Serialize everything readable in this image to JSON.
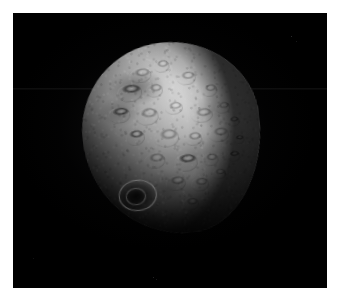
{
  "page": {
    "background_color": "#ffffff",
    "width": 343,
    "height": 302
  },
  "image_frame": {
    "name": "spacecraft-image-frame",
    "background_color": "#000000",
    "left": 13,
    "top": 13,
    "width": 314,
    "height": 275,
    "alt_text": "Grayscale spacecraft image of a heavily cratered irregular asteroid or comet nucleus against black space"
  },
  "subject": {
    "name": "asteroid-nucleus",
    "description": "Irregular, roughly rounded cratered body filling the left-of-center portion of the frame",
    "illumination": "Lit from the upper right; terminator shadow falls across the lower-left limb",
    "surface": "Densely cratered regolith with overlapping impact basins and bright crater rims",
    "bounds": {
      "left": 83,
      "top": 42,
      "right": 248,
      "bottom": 234
    },
    "highlight_color": "#d9d9d9",
    "midtone_color": "#a4a4a4",
    "shadow_color": "#141414",
    "features": [
      {
        "name": "bright-limb-highlight",
        "position": "upper-right",
        "note": "Brightest illuminated region near the sunward limb"
      },
      {
        "name": "dark-albedo-patch",
        "position": "upper-left",
        "note": "Broad low-reflectance smudge along the upper-left flank"
      },
      {
        "name": "large-rimmed-crater",
        "position": "lower-left-terminator",
        "note": "Prominent crater with a bright raised rim catching the light at the shadow boundary"
      },
      {
        "name": "crater-chain",
        "position": "right-limb",
        "note": "Row of small craters silhouetted along the illuminated right edge"
      },
      {
        "name": "terminator",
        "position": "lower-left",
        "note": "Curved shadow boundary separating the lit face from the unlit night side"
      }
    ]
  },
  "artifacts": {
    "scanline": {
      "name": "horizontal-scanline",
      "note": "Faint bright horizontal detector line across the upper sky"
    },
    "noise_specks": {
      "name": "sensor-noise-specks",
      "count": 4,
      "note": "Isolated faint pixels in the dark sky field"
    }
  },
  "caption": {
    "text": ""
  }
}
